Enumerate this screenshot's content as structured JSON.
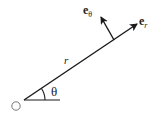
{
  "diagram": {
    "origin_label": "O",
    "radius_label": "r",
    "angle_label": "θ",
    "unit_vector_r": {
      "base": "e",
      "sub": "r"
    },
    "unit_vector_theta": {
      "base": "e",
      "sub": "θ"
    },
    "colors": {
      "stroke": "#1a1a1a",
      "origin": "#777777",
      "text": "#222222"
    }
  }
}
